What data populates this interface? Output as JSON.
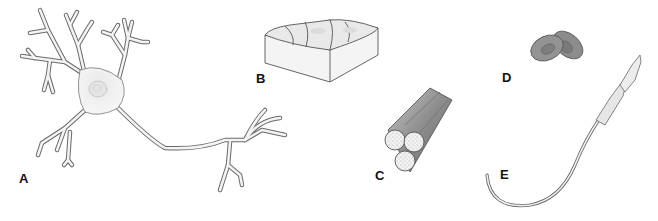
{
  "figure": {
    "panels": [
      {
        "label": "A",
        "subject": "neuron"
      },
      {
        "label": "B",
        "subject": "epithelial tissue block"
      },
      {
        "label": "C",
        "subject": "muscle fiber bundle"
      },
      {
        "label": "D",
        "subject": "red blood cells"
      },
      {
        "label": "E",
        "subject": "sperm cell"
      }
    ]
  },
  "colors": {
    "outline": "#555555",
    "cell_fill": "#f0f0f0",
    "rbc_fill": "#8a8a8a",
    "muscle_fill": "#9a9a9a",
    "label": "#111111"
  }
}
